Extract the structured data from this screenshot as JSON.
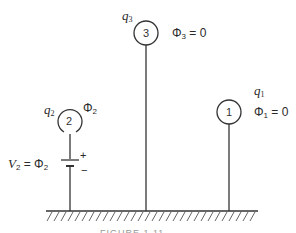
{
  "diagram": {
    "conductors": [
      {
        "id": "1",
        "number": "1",
        "charge_label": "q",
        "charge_sub": "1",
        "potential_label": "Φ",
        "potential_sub": "1",
        "potential_value": " = 0"
      },
      {
        "id": "2",
        "number": "2",
        "charge_label": "q",
        "charge_sub": "2",
        "potential_label": "Φ",
        "potential_sub": "2",
        "potential_value": ""
      },
      {
        "id": "3",
        "number": "3",
        "charge_label": "q",
        "charge_sub": "3",
        "potential_label": "Φ",
        "potential_sub": "3",
        "potential_value": " = 0"
      }
    ],
    "battery": {
      "voltage_label": "V",
      "voltage_sub": "2",
      "equals": " = Φ",
      "equals_sub": "2",
      "plus": "+",
      "minus": "−"
    },
    "ground": "ground",
    "caption": "FIGURE 1.11"
  }
}
